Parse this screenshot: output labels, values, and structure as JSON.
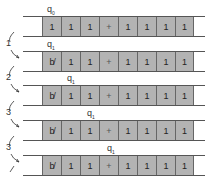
{
  "diagram": {
    "rows": [
      {
        "state": "q",
        "sub": "0",
        "cells": [
          "1",
          "1",
          "1",
          "+",
          "1",
          "1",
          "1",
          "1"
        ],
        "head": 0,
        "first_blank": false
      },
      {
        "state": "q",
        "sub": "1",
        "cells": [
          "b̸",
          "1",
          "1",
          "+",
          "1",
          "1",
          "1",
          "1"
        ],
        "head": 0,
        "first_blank": true
      },
      {
        "state": "q",
        "sub": "1",
        "cells": [
          "b̸",
          "1",
          "1",
          "+",
          "1",
          "1",
          "1",
          "1"
        ],
        "head": 1,
        "first_blank": true
      },
      {
        "state": "q",
        "sub": "1",
        "cells": [
          "b̸",
          "1",
          "1",
          "+",
          "1",
          "1",
          "1",
          "1"
        ],
        "head": 2,
        "first_blank": true
      },
      {
        "state": "q",
        "sub": "1",
        "cells": [
          "b̸",
          "1",
          "1",
          "+",
          "1",
          "1",
          "1",
          "1"
        ],
        "head": 3,
        "first_blank": true
      }
    ],
    "steps": [
      "1",
      "2",
      "3",
      "3"
    ],
    "colors": {
      "cell_fill": "#b3b3b3",
      "line": "#555555",
      "text": "#222222"
    }
  }
}
